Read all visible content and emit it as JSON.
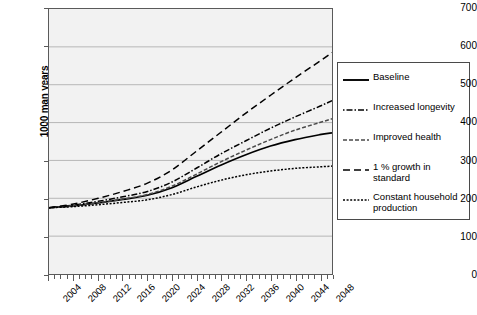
{
  "chart_data": {
    "type": "line",
    "title": "",
    "xlabel": "",
    "ylabel": "1000 man years",
    "xlim": [
      2004,
      2050
    ],
    "ylim": [
      0,
      700
    ],
    "ytick_step": 100,
    "yticks": [
      0,
      100,
      200,
      300,
      400,
      500,
      600,
      700
    ],
    "xticks": [
      2004,
      2008,
      2012,
      2016,
      2020,
      2024,
      2028,
      2032,
      2036,
      2040,
      2044,
      2048
    ],
    "xtick_minor_step": 1,
    "grid": "horizontal",
    "legend_position": "right",
    "plot_background": "#f2f2f2",
    "gridline_color": "#a8a8a8",
    "x": [
      2004,
      2008,
      2012,
      2016,
      2020,
      2024,
      2028,
      2032,
      2036,
      2040,
      2044,
      2048,
      2050
    ],
    "series": [
      {
        "name": "Baseline",
        "style": "solid",
        "color": "#000000",
        "values": [
          175,
          180,
          188,
          197,
          208,
          228,
          258,
          288,
          315,
          338,
          355,
          368,
          373
        ]
      },
      {
        "name": "Increased longevity",
        "style": "dash-dot",
        "color": "#000000",
        "values": [
          175,
          182,
          192,
          204,
          218,
          243,
          280,
          318,
          352,
          385,
          415,
          443,
          458
        ]
      },
      {
        "name": "Improved health",
        "style": "short-dash-gray",
        "color": "#4a4a4a",
        "values": [
          175,
          180,
          188,
          198,
          210,
          232,
          264,
          297,
          327,
          355,
          380,
          400,
          410
        ]
      },
      {
        "name": "1 % growth in standard",
        "style": "long-dash",
        "color": "#000000",
        "values": [
          175,
          185,
          200,
          218,
          240,
          275,
          325,
          375,
          425,
          472,
          518,
          562,
          585
        ]
      },
      {
        "name": "Constant household production",
        "style": "dotted",
        "color": "#000000",
        "values": [
          175,
          178,
          183,
          189,
          196,
          210,
          230,
          248,
          262,
          272,
          279,
          283,
          285
        ]
      }
    ]
  },
  "legend": {
    "items": [
      {
        "label": "Baseline"
      },
      {
        "label": "Increased longevity"
      },
      {
        "label": "Improved health"
      },
      {
        "label": "1 % growth in standard"
      },
      {
        "label": "Constant household\nproduction"
      }
    ]
  }
}
